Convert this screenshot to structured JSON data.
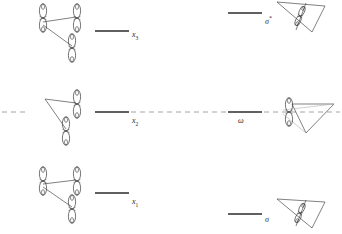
{
  "figure": {
    "background_color": "#ffffff",
    "line_color": "#2b2b2b",
    "orbital_stroke": "#3a3a3a",
    "dashed_color": "#8c8c8c",
    "width": 342,
    "height": 234
  },
  "levels": {
    "left_column": [
      {
        "id": "x3",
        "label": "x",
        "subscript": "3",
        "y": 31,
        "x_start": 95,
        "x_end": 129
      },
      {
        "id": "x2",
        "label": "x",
        "subscript": "2",
        "y": 112,
        "x_start": 95,
        "x_end": 129
      },
      {
        "id": "x1",
        "label": "x",
        "subscript": "1",
        "y": 193,
        "x_start": 95,
        "x_end": 129
      }
    ],
    "right_column": [
      {
        "id": "sigma-star",
        "label": "σ",
        "superscript": "*",
        "y": 13,
        "x_start": 228,
        "x_end": 262
      },
      {
        "id": "omega",
        "label": "ω",
        "superscript": "",
        "y": 112,
        "x_start": 228,
        "x_end": 262
      },
      {
        "id": "sigma",
        "label": "σ",
        "superscript": "",
        "y": 214,
        "x_start": 228,
        "x_end": 262
      }
    ]
  },
  "label_text": {
    "x3": "x",
    "x3_sub": "3",
    "x2": "x",
    "x2_sub": "2",
    "x1": "x",
    "x1_sub": "1",
    "sigma_star": "σ",
    "sigma_star_sup": "*",
    "omega": "ω",
    "sigma": "σ"
  },
  "nonbonding_line": {
    "name": "nonbonding-reference-dashed-line",
    "y": 112,
    "segments": [
      {
        "x_start": 2,
        "x_end": 28
      },
      {
        "x_start": 131,
        "x_end": 226
      },
      {
        "x_start": 264,
        "x_end": 340
      }
    ]
  },
  "structures": {
    "left": [
      {
        "id": "x3-orbital-structure",
        "cx": 62,
        "cy": 30,
        "caption": "three p-orbital cluster, upper"
      },
      {
        "id": "x2-orbital-structure",
        "cx": 62,
        "cy": 112,
        "caption": "two p-orbital cluster with vertex, middle"
      },
      {
        "id": "x1-orbital-structure",
        "cx": 62,
        "cy": 193,
        "caption": "three p-orbital cluster, lower"
      }
    ],
    "right": [
      {
        "id": "sigma-star-structure",
        "cx": 300,
        "cy": 16,
        "caption": "triangular framework with orbital, upper"
      },
      {
        "id": "omega-structure",
        "cx": 300,
        "cy": 114,
        "caption": "triangular framework with orbital, middle"
      },
      {
        "id": "sigma-structure",
        "cx": 300,
        "cy": 212,
        "caption": "triangular framework with orbital, lower"
      }
    ]
  }
}
